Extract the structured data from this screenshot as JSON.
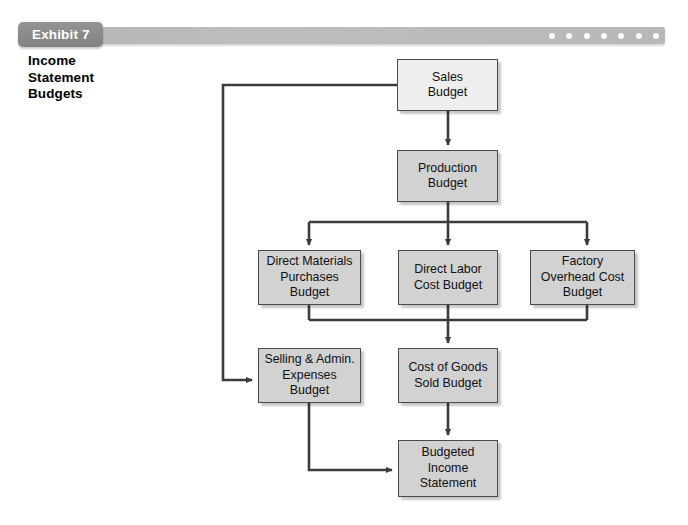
{
  "exhibit": {
    "tab_label": "Exhibit 7",
    "title_lines": [
      "Income",
      "Statement",
      "Budgets"
    ],
    "banner_dot_count": 7
  },
  "colors": {
    "banner_bar": "#b8b8b8",
    "exhibit_tab": "#8a8a8a",
    "node_fill_gray": "#d2d2d2",
    "node_fill_light": "#eeeeee",
    "node_border": "#4a4a4a",
    "connector": "#3c3c3c",
    "text": "#111111",
    "background": "#ffffff"
  },
  "chart_data": {
    "type": "diagram",
    "title": "Income Statement Budgets",
    "nodes": [
      {
        "id": "sales",
        "label": "Sales\nBudget",
        "lines": [
          "Sales",
          "Budget"
        ],
        "fill": "light",
        "x": 397,
        "y": 59,
        "w": 101,
        "h": 52
      },
      {
        "id": "production",
        "label": "Production\nBudget",
        "lines": [
          "Production",
          "Budget"
        ],
        "fill": "gray",
        "x": 397,
        "y": 150,
        "w": 101,
        "h": 52
      },
      {
        "id": "dmp",
        "label": "Direct Materials\nPurchases\nBudget",
        "lines": [
          "Direct Materials",
          "Purchases",
          "Budget"
        ],
        "fill": "gray",
        "x": 258,
        "y": 250,
        "w": 103,
        "h": 55
      },
      {
        "id": "dlc",
        "label": "Direct Labor\nCost Budget",
        "lines": [
          "Direct Labor",
          "Cost Budget"
        ],
        "fill": "gray",
        "x": 398,
        "y": 250,
        "w": 100,
        "h": 55
      },
      {
        "id": "foh",
        "label": "Factory\nOverhead Cost\nBudget",
        "lines": [
          "Factory",
          "Overhead Cost",
          "Budget"
        ],
        "fill": "gray",
        "x": 530,
        "y": 250,
        "w": 105,
        "h": 55
      },
      {
        "id": "sga",
        "label": "Selling & Admin.\nExpenses\nBudget",
        "lines": [
          "Selling & Admin.",
          "Expenses",
          "Budget"
        ],
        "fill": "gray",
        "x": 258,
        "y": 348,
        "w": 103,
        "h": 55
      },
      {
        "id": "cogs",
        "label": "Cost of Goods\nSold Budget",
        "lines": [
          "Cost of Goods",
          "Sold Budget"
        ],
        "fill": "gray",
        "x": 398,
        "y": 348,
        "w": 100,
        "h": 55
      },
      {
        "id": "bis",
        "label": "Budgeted\nIncome\nStatement",
        "lines": [
          "Budgeted",
          "Income",
          "Statement"
        ],
        "fill": "gray",
        "x": 398,
        "y": 440,
        "w": 100,
        "h": 57
      }
    ],
    "edges": [
      {
        "from": "sales",
        "to": "production",
        "style": "straight-down"
      },
      {
        "from": "sales",
        "to": "sga",
        "style": "left-bus-around"
      },
      {
        "from": "production",
        "to": "dmp",
        "style": "split-bus"
      },
      {
        "from": "production",
        "to": "dlc",
        "style": "split-bus"
      },
      {
        "from": "production",
        "to": "foh",
        "style": "split-bus"
      },
      {
        "from": "dmp",
        "to": "cogs",
        "style": "merge-bus"
      },
      {
        "from": "dlc",
        "to": "cogs",
        "style": "merge-bus"
      },
      {
        "from": "foh",
        "to": "cogs",
        "style": "merge-bus"
      },
      {
        "from": "cogs",
        "to": "bis",
        "style": "straight-down"
      },
      {
        "from": "sga",
        "to": "bis",
        "style": "down-then-right"
      }
    ]
  }
}
